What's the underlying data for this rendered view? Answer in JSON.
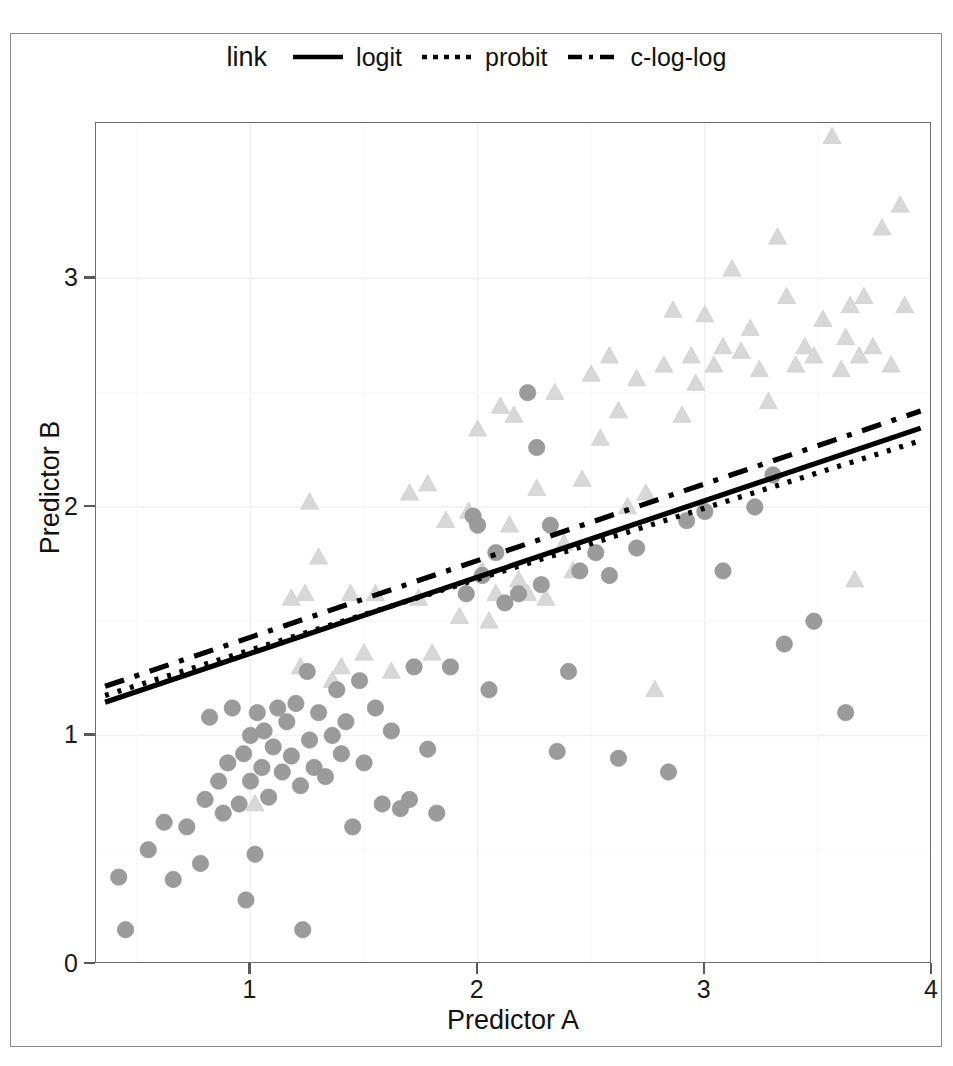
{
  "legend": {
    "title": "link",
    "items": [
      {
        "label": "logit",
        "key": "solid-line-key",
        "dash": "none",
        "color": "#000000"
      },
      {
        "label": "probit",
        "key": "dotted-line-key",
        "dash": "dotted",
        "color": "#000000"
      },
      {
        "label": "c-log-log",
        "key": "dashed-line-key",
        "dash": "dashed",
        "color": "#000000"
      }
    ]
  },
  "axes": {
    "xlabel": "Predictor A",
    "ylabel": "Predictor B",
    "xticks": [
      "1",
      "2",
      "3",
      "4"
    ],
    "yticks": [
      "0",
      "1",
      "2",
      "3"
    ]
  },
  "colors": {
    "circle_fill": "#9b9b9b",
    "triangle_fill": "#d8d8d8",
    "panel_border": "#6d6d6d",
    "grid": "#f0f0f0",
    "line": "#000000",
    "text": "#111111"
  },
  "chart_data": {
    "type": "scatter",
    "title": "",
    "xlabel": "Predictor A",
    "ylabel": "Predictor B",
    "xlim": [
      0.32,
      4.0
    ],
    "ylim": [
      0.0,
      3.68
    ],
    "xticks": [
      1,
      2,
      3,
      4
    ],
    "yticks": [
      0,
      1,
      2,
      3
    ],
    "grid": true,
    "legend_position": "top",
    "legend_title": "link",
    "series": [
      {
        "name": "group-circles",
        "marker": "circle",
        "color": "#9b9b9b",
        "points": [
          [
            0.45,
            0.15
          ],
          [
            0.42,
            0.38
          ],
          [
            0.55,
            0.5
          ],
          [
            0.62,
            0.62
          ],
          [
            0.66,
            0.37
          ],
          [
            0.72,
            0.6
          ],
          [
            0.78,
            0.44
          ],
          [
            0.8,
            0.72
          ],
          [
            0.82,
            1.08
          ],
          [
            0.86,
            0.8
          ],
          [
            0.88,
            0.66
          ],
          [
            0.9,
            0.88
          ],
          [
            0.92,
            1.12
          ],
          [
            0.95,
            0.7
          ],
          [
            0.97,
            0.92
          ],
          [
            0.98,
            0.28
          ],
          [
            1.0,
            1.0
          ],
          [
            1.0,
            0.8
          ],
          [
            1.02,
            0.48
          ],
          [
            1.03,
            1.1
          ],
          [
            1.05,
            0.86
          ],
          [
            1.06,
            1.02
          ],
          [
            1.08,
            0.73
          ],
          [
            1.1,
            0.95
          ],
          [
            1.12,
            1.12
          ],
          [
            1.14,
            0.84
          ],
          [
            1.16,
            1.06
          ],
          [
            1.18,
            0.91
          ],
          [
            1.2,
            1.14
          ],
          [
            1.22,
            0.78
          ],
          [
            1.23,
            0.15
          ],
          [
            1.25,
            1.28
          ],
          [
            1.26,
            0.98
          ],
          [
            1.28,
            0.86
          ],
          [
            1.3,
            1.1
          ],
          [
            1.33,
            0.82
          ],
          [
            1.36,
            1.0
          ],
          [
            1.38,
            1.2
          ],
          [
            1.4,
            0.92
          ],
          [
            1.42,
            1.06
          ],
          [
            1.45,
            0.6
          ],
          [
            1.48,
            1.24
          ],
          [
            1.5,
            0.88
          ],
          [
            1.55,
            1.12
          ],
          [
            1.58,
            0.7
          ],
          [
            1.62,
            1.02
          ],
          [
            1.66,
            0.68
          ],
          [
            1.7,
            0.72
          ],
          [
            1.72,
            1.3
          ],
          [
            1.78,
            0.94
          ],
          [
            1.82,
            0.66
          ],
          [
            1.88,
            1.3
          ],
          [
            1.95,
            1.62
          ],
          [
            1.98,
            1.96
          ],
          [
            2.0,
            1.92
          ],
          [
            2.02,
            1.7
          ],
          [
            2.05,
            1.2
          ],
          [
            2.08,
            1.8
          ],
          [
            2.12,
            1.58
          ],
          [
            2.18,
            1.62
          ],
          [
            2.22,
            2.5
          ],
          [
            2.26,
            2.26
          ],
          [
            2.28,
            1.66
          ],
          [
            2.32,
            1.92
          ],
          [
            2.35,
            0.93
          ],
          [
            2.4,
            1.28
          ],
          [
            2.45,
            1.72
          ],
          [
            2.52,
            1.8
          ],
          [
            2.58,
            1.7
          ],
          [
            2.62,
            0.9
          ],
          [
            2.7,
            1.82
          ],
          [
            2.84,
            0.84
          ],
          [
            2.92,
            1.94
          ],
          [
            3.0,
            1.98
          ],
          [
            3.08,
            1.72
          ],
          [
            3.22,
            2.0
          ],
          [
            3.3,
            2.14
          ],
          [
            3.35,
            1.4
          ],
          [
            3.48,
            1.5
          ],
          [
            3.62,
            1.1
          ]
        ]
      },
      {
        "name": "group-triangles",
        "marker": "triangle",
        "color": "#d8d8d8",
        "points": [
          [
            1.02,
            0.7
          ],
          [
            1.18,
            1.6
          ],
          [
            1.22,
            1.3
          ],
          [
            1.24,
            1.62
          ],
          [
            1.26,
            2.02
          ],
          [
            1.3,
            1.78
          ],
          [
            1.36,
            1.24
          ],
          [
            1.4,
            1.3
          ],
          [
            1.44,
            1.62
          ],
          [
            1.5,
            1.36
          ],
          [
            1.55,
            1.62
          ],
          [
            1.62,
            1.28
          ],
          [
            1.7,
            2.06
          ],
          [
            1.74,
            1.6
          ],
          [
            1.78,
            2.1
          ],
          [
            1.8,
            1.36
          ],
          [
            1.86,
            1.94
          ],
          [
            1.92,
            1.52
          ],
          [
            1.96,
            1.98
          ],
          [
            2.0,
            2.34
          ],
          [
            2.02,
            1.72
          ],
          [
            2.05,
            1.5
          ],
          [
            2.08,
            1.62
          ],
          [
            2.1,
            2.44
          ],
          [
            2.14,
            1.92
          ],
          [
            2.16,
            2.4
          ],
          [
            2.18,
            1.68
          ],
          [
            2.22,
            1.62
          ],
          [
            2.26,
            2.08
          ],
          [
            2.3,
            1.6
          ],
          [
            2.34,
            2.5
          ],
          [
            2.38,
            1.84
          ],
          [
            2.42,
            1.72
          ],
          [
            2.46,
            2.12
          ],
          [
            2.5,
            2.58
          ],
          [
            2.54,
            2.3
          ],
          [
            2.58,
            2.66
          ],
          [
            2.62,
            2.42
          ],
          [
            2.66,
            2.0
          ],
          [
            2.7,
            2.56
          ],
          [
            2.74,
            2.06
          ],
          [
            2.78,
            1.2
          ],
          [
            2.82,
            2.62
          ],
          [
            2.86,
            2.86
          ],
          [
            2.9,
            2.4
          ],
          [
            2.94,
            2.66
          ],
          [
            2.96,
            2.54
          ],
          [
            3.0,
            2.84
          ],
          [
            3.04,
            2.62
          ],
          [
            3.08,
            2.7
          ],
          [
            3.12,
            3.04
          ],
          [
            3.16,
            2.68
          ],
          [
            3.2,
            2.78
          ],
          [
            3.24,
            2.6
          ],
          [
            3.28,
            2.46
          ],
          [
            3.32,
            3.18
          ],
          [
            3.36,
            2.92
          ],
          [
            3.4,
            2.62
          ],
          [
            3.44,
            2.7
          ],
          [
            3.48,
            2.66
          ],
          [
            3.52,
            2.82
          ],
          [
            3.56,
            3.62
          ],
          [
            3.6,
            2.6
          ],
          [
            3.62,
            2.74
          ],
          [
            3.64,
            2.88
          ],
          [
            3.66,
            1.68
          ],
          [
            3.68,
            2.66
          ],
          [
            3.7,
            2.92
          ],
          [
            3.74,
            2.7
          ],
          [
            3.78,
            3.22
          ],
          [
            3.82,
            2.62
          ],
          [
            3.86,
            3.32
          ],
          [
            3.88,
            2.88
          ]
        ]
      }
    ],
    "fit_lines": [
      {
        "name": "logit",
        "dash": "none",
        "x": [
          0.36,
          3.95
        ],
        "y": [
          1.145,
          2.345
        ]
      },
      {
        "name": "probit",
        "dash": "dotted",
        "x": [
          0.36,
          3.95
        ],
        "y": [
          1.175,
          2.29
        ]
      },
      {
        "name": "c-log-log",
        "dash": "dashed",
        "x": [
          0.36,
          3.95
        ],
        "y": [
          1.215,
          2.42
        ]
      }
    ]
  }
}
